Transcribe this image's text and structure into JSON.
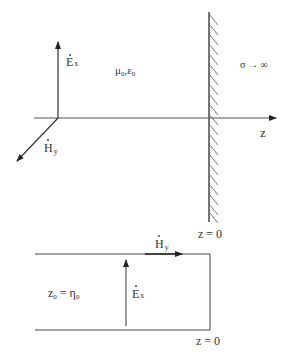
{
  "upper_diagram": {
    "e_field_label": "E",
    "e_field_sub": "x",
    "h_field_label": "H",
    "h_field_sub": "y",
    "medium_label": "μ",
    "medium_sub1": "0",
    "medium_sep": ",ε",
    "medium_sub2": "0",
    "conductor_label": "σ → ∞",
    "axis_label": "z",
    "boundary_label": "z = 0"
  },
  "lower_diagram": {
    "h_field_label": "H",
    "h_field_sub": "y",
    "e_field_label": "E",
    "e_field_sub": "x",
    "impedance_label": "z",
    "impedance_sub1": "0",
    "impedance_eq": " = η",
    "impedance_sub2": "0",
    "boundary_label": "z = 0"
  },
  "colors": {
    "line": "#333333",
    "wall": "#555555"
  }
}
